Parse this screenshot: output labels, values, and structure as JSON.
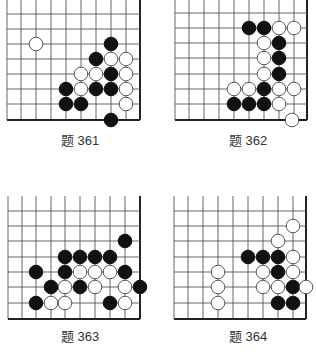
{
  "problems": [
    {
      "label": "题 361",
      "grid": {
        "xs": [
          7,
          21,
          36,
          51,
          66,
          81,
          96,
          111,
          126,
          140
        ],
        "ys": [
          0,
          14,
          29,
          44,
          59,
          74,
          89,
          104,
          120
        ],
        "right_edge": 140,
        "bottom_edge": 120
      },
      "label_pos": {
        "x": 40,
        "y": 140
      },
      "stones": [
        {
          "x": 36,
          "y": 44,
          "color": "white"
        },
        {
          "x": 111,
          "y": 44,
          "color": "black"
        },
        {
          "x": 96,
          "y": 59,
          "color": "black"
        },
        {
          "x": 111,
          "y": 59,
          "color": "white"
        },
        {
          "x": 126,
          "y": 59,
          "color": "white"
        },
        {
          "x": 81,
          "y": 74,
          "color": "white"
        },
        {
          "x": 96,
          "y": 74,
          "color": "white"
        },
        {
          "x": 111,
          "y": 74,
          "color": "black"
        },
        {
          "x": 126,
          "y": 74,
          "color": "white"
        },
        {
          "x": 66,
          "y": 89,
          "color": "black"
        },
        {
          "x": 81,
          "y": 89,
          "color": "white"
        },
        {
          "x": 96,
          "y": 89,
          "color": "black"
        },
        {
          "x": 111,
          "y": 89,
          "color": "black"
        },
        {
          "x": 126,
          "y": 89,
          "color": "white"
        },
        {
          "x": 66,
          "y": 104,
          "color": "black"
        },
        {
          "x": 81,
          "y": 104,
          "color": "black"
        },
        {
          "x": 126,
          "y": 104,
          "color": "white"
        },
        {
          "x": 111,
          "y": 120,
          "color": "black"
        }
      ]
    },
    {
      "label": "题 362",
      "grid": {
        "xs": [
          175,
          189,
          204,
          219,
          234,
          249,
          264,
          279,
          294,
          307
        ],
        "ys": [
          0,
          13,
          28,
          43,
          58,
          74,
          89,
          104,
          120
        ],
        "right_edge": 307,
        "bottom_edge": 120
      },
      "label_pos": {
        "x": 208,
        "y": 140
      },
      "stones": [
        {
          "x": 249,
          "y": 28,
          "color": "black"
        },
        {
          "x": 264,
          "y": 28,
          "color": "black"
        },
        {
          "x": 279,
          "y": 28,
          "color": "white"
        },
        {
          "x": 294,
          "y": 28,
          "color": "white"
        },
        {
          "x": 264,
          "y": 43,
          "color": "white"
        },
        {
          "x": 279,
          "y": 43,
          "color": "black"
        },
        {
          "x": 264,
          "y": 58,
          "color": "white"
        },
        {
          "x": 279,
          "y": 58,
          "color": "black"
        },
        {
          "x": 264,
          "y": 74,
          "color": "white"
        },
        {
          "x": 279,
          "y": 74,
          "color": "black"
        },
        {
          "x": 234,
          "y": 89,
          "color": "white"
        },
        {
          "x": 249,
          "y": 89,
          "color": "white"
        },
        {
          "x": 264,
          "y": 89,
          "color": "black"
        },
        {
          "x": 279,
          "y": 89,
          "color": "white"
        },
        {
          "x": 294,
          "y": 89,
          "color": "white"
        },
        {
          "x": 234,
          "y": 104,
          "color": "black"
        },
        {
          "x": 249,
          "y": 104,
          "color": "black"
        },
        {
          "x": 264,
          "y": 104,
          "color": "black"
        },
        {
          "x": 279,
          "y": 104,
          "color": "white"
        },
        {
          "x": 292,
          "y": 120,
          "color": "white"
        }
      ]
    },
    {
      "label": "题 363",
      "grid": {
        "xs": [
          8,
          22,
          36,
          51,
          65,
          80,
          95,
          110,
          125,
          140
        ],
        "ys": [
          196,
          211,
          226,
          241,
          257,
          272,
          287,
          303,
          319
        ],
        "right_edge": 140,
        "bottom_edge": 319
      },
      "label_pos": {
        "x": 40,
        "y": 336
      },
      "stones": [
        {
          "x": 125,
          "y": 241,
          "color": "black"
        },
        {
          "x": 65,
          "y": 257,
          "color": "black"
        },
        {
          "x": 80,
          "y": 257,
          "color": "black"
        },
        {
          "x": 95,
          "y": 257,
          "color": "black"
        },
        {
          "x": 110,
          "y": 257,
          "color": "black"
        },
        {
          "x": 36,
          "y": 272,
          "color": "black"
        },
        {
          "x": 65,
          "y": 272,
          "color": "black"
        },
        {
          "x": 80,
          "y": 272,
          "color": "white"
        },
        {
          "x": 95,
          "y": 272,
          "color": "white"
        },
        {
          "x": 110,
          "y": 272,
          "color": "white"
        },
        {
          "x": 125,
          "y": 272,
          "color": "black"
        },
        {
          "x": 51,
          "y": 287,
          "color": "black"
        },
        {
          "x": 65,
          "y": 287,
          "color": "white"
        },
        {
          "x": 80,
          "y": 287,
          "color": "black"
        },
        {
          "x": 95,
          "y": 287,
          "color": "white"
        },
        {
          "x": 125,
          "y": 287,
          "color": "white"
        },
        {
          "x": 140,
          "y": 287,
          "color": "black"
        },
        {
          "x": 36,
          "y": 303,
          "color": "black"
        },
        {
          "x": 51,
          "y": 303,
          "color": "white"
        },
        {
          "x": 65,
          "y": 303,
          "color": "white"
        },
        {
          "x": 110,
          "y": 303,
          "color": "black"
        },
        {
          "x": 125,
          "y": 303,
          "color": "white"
        }
      ]
    },
    {
      "label": "题 364",
      "grid": {
        "xs": [
          174,
          188,
          203,
          218,
          233,
          248,
          263,
          278,
          293,
          306
        ],
        "ys": [
          196,
          211,
          226,
          241,
          257,
          272,
          287,
          303,
          319
        ],
        "right_edge": 306,
        "bottom_edge": 319
      },
      "label_pos": {
        "x": 208,
        "y": 336
      },
      "stones": [
        {
          "x": 293,
          "y": 226,
          "color": "white"
        },
        {
          "x": 278,
          "y": 241,
          "color": "white"
        },
        {
          "x": 248,
          "y": 257,
          "color": "black"
        },
        {
          "x": 263,
          "y": 257,
          "color": "black"
        },
        {
          "x": 278,
          "y": 257,
          "color": "black"
        },
        {
          "x": 293,
          "y": 257,
          "color": "white"
        },
        {
          "x": 218,
          "y": 272,
          "color": "white"
        },
        {
          "x": 263,
          "y": 272,
          "color": "white"
        },
        {
          "x": 278,
          "y": 272,
          "color": "black"
        },
        {
          "x": 293,
          "y": 272,
          "color": "white"
        },
        {
          "x": 218,
          "y": 287,
          "color": "white"
        },
        {
          "x": 263,
          "y": 287,
          "color": "white"
        },
        {
          "x": 278,
          "y": 287,
          "color": "white"
        },
        {
          "x": 293,
          "y": 287,
          "color": "black"
        },
        {
          "x": 306,
          "y": 287,
          "color": "white"
        },
        {
          "x": 218,
          "y": 303,
          "color": "white"
        },
        {
          "x": 278,
          "y": 303,
          "color": "black"
        },
        {
          "x": 293,
          "y": 303,
          "color": "black"
        }
      ]
    }
  ],
  "colors": {
    "grid": "#555555",
    "edge": "#222222",
    "black_stone": "#111111",
    "white_stone": "#ffffff",
    "white_outline": "#444444"
  }
}
